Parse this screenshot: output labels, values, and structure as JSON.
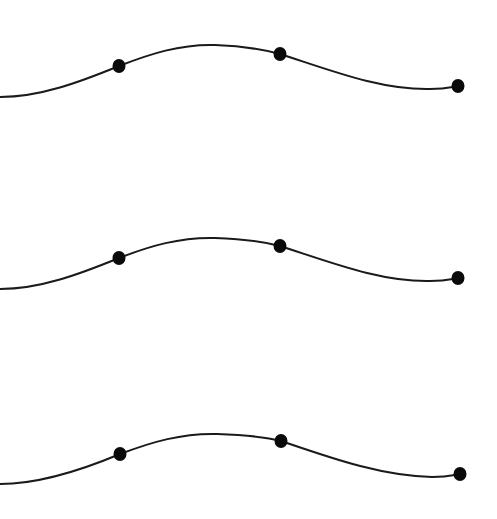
{
  "diagram": {
    "canvas": {
      "width": 497,
      "height": 519,
      "background": "#ffffff"
    },
    "stroke_color": "#1a1a1a",
    "dot_color": "#0a0a0a",
    "curves": [
      {
        "name": "curve-1",
        "path": "M 0 97 C 40 97, 80 82, 119 66 C 150 54, 180 44, 215 45 C 245 46, 265 50, 280 54 C 330 70, 380 90, 430 89 C 445 89, 452 87, 458 86",
        "dots": [
          {
            "x": 119,
            "y": 66,
            "rx": 6.5,
            "ry": 7
          },
          {
            "x": 280,
            "y": 54,
            "rx": 6.5,
            "ry": 7
          },
          {
            "x": 458,
            "y": 86,
            "rx": 6.5,
            "ry": 7
          }
        ]
      },
      {
        "name": "curve-2",
        "path": "M 0 289 C 40 289, 80 274, 119 258 C 150 246, 180 237, 215 238 C 245 239, 265 242, 280 246 C 330 262, 380 282, 430 281 C 445 281, 452 279, 458 278",
        "dots": [
          {
            "x": 119,
            "y": 258,
            "rx": 6.5,
            "ry": 7
          },
          {
            "x": 280,
            "y": 246,
            "rx": 6.5,
            "ry": 7
          },
          {
            "x": 458,
            "y": 278,
            "rx": 6.5,
            "ry": 7
          }
        ]
      },
      {
        "name": "curve-3",
        "path": "M 0 484 C 40 484, 82 470, 120 454 C 152 442, 182 433, 217 434 C 247 435, 266 437, 281 441 C 331 458, 381 476, 432 477 C 447 477, 454 475, 460 474",
        "dots": [
          {
            "x": 120,
            "y": 454,
            "rx": 6.5,
            "ry": 7
          },
          {
            "x": 281,
            "y": 441,
            "rx": 6.5,
            "ry": 7
          },
          {
            "x": 460,
            "y": 474,
            "rx": 6.5,
            "ry": 7
          }
        ]
      }
    ]
  }
}
